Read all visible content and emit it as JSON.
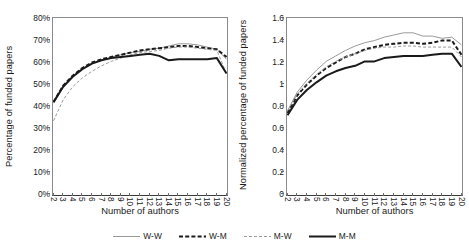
{
  "figure": {
    "background": "#ffffff",
    "axis_color": "#8a8a8a"
  },
  "legend": {
    "position": "bottom-center",
    "entries": [
      {
        "label": "W-W",
        "style": "solid",
        "color": "#9a9a9a",
        "width": 1.0,
        "name": "legend-item-w-w"
      },
      {
        "label": "W-M",
        "style": "dashed",
        "color": "#1a1a1a",
        "width": 2.0,
        "name": "legend-item-w-m"
      },
      {
        "label": "M-W",
        "style": "dashed",
        "color": "#9a9a9a",
        "width": 1.0,
        "name": "legend-item-m-w"
      },
      {
        "label": "M-M",
        "style": "solid",
        "color": "#1a1a1a",
        "width": 2.0,
        "name": "legend-item-m-m"
      }
    ]
  },
  "chart_data": [
    {
      "type": "line",
      "id": "left",
      "title": "",
      "xlabel": "Number of authors",
      "ylabel": "Percentage of funded papers",
      "x": [
        2,
        3,
        4,
        5,
        6,
        7,
        8,
        9,
        10,
        11,
        12,
        13,
        14,
        15,
        16,
        17,
        18,
        19,
        20
      ],
      "xlim": [
        2,
        20
      ],
      "xticklabels": [
        "2",
        "3",
        "4",
        "5",
        "6",
        "7",
        "8",
        "9",
        "10",
        "11",
        "12",
        "13",
        "14",
        "15",
        "16",
        "17",
        "18",
        "19",
        "20"
      ],
      "ylim": [
        0,
        80
      ],
      "yticks": [
        0,
        10,
        20,
        30,
        40,
        50,
        60,
        70,
        80
      ],
      "yticklabels": [
        "0%",
        "10%",
        "20%",
        "30%",
        "40%",
        "50%",
        "60%",
        "70%",
        "80%"
      ],
      "yunit": "%",
      "grid": false,
      "series": [
        {
          "name": "W-W",
          "values": [
            41.5,
            48.5,
            53.5,
            57.0,
            59.5,
            61.0,
            62.5,
            63.5,
            64.5,
            65.0,
            66.0,
            66.5,
            67.5,
            68.5,
            68.5,
            68.0,
            67.0,
            66.0,
            61.5
          ]
        },
        {
          "name": "W-M",
          "values": [
            42.0,
            49.5,
            54.0,
            57.5,
            60.0,
            61.5,
            62.5,
            63.5,
            64.5,
            65.5,
            66.0,
            66.5,
            67.0,
            67.5,
            67.5,
            67.0,
            66.5,
            66.0,
            62.5
          ]
        },
        {
          "name": "M-W",
          "values": [
            33.5,
            43.0,
            49.0,
            53.0,
            56.0,
            58.5,
            60.5,
            62.0,
            63.5,
            64.5,
            65.0,
            65.5,
            66.5,
            67.0,
            67.0,
            66.5,
            66.0,
            65.5,
            55.0
          ]
        },
        {
          "name": "M-M",
          "values": [
            42.0,
            49.0,
            53.5,
            57.0,
            59.5,
            61.0,
            62.0,
            62.5,
            63.0,
            63.5,
            64.0,
            63.0,
            61.0,
            61.5,
            61.5,
            61.5,
            61.5,
            62.0,
            55.0
          ]
        }
      ]
    },
    {
      "type": "line",
      "id": "right",
      "title": "",
      "xlabel": "Number of authors",
      "ylabel": "Normalized percentage of funded papers",
      "x": [
        2,
        3,
        4,
        5,
        6,
        7,
        8,
        9,
        10,
        11,
        12,
        13,
        14,
        15,
        16,
        17,
        18,
        19,
        20
      ],
      "xlim": [
        2,
        20
      ],
      "xticklabels": [
        "2",
        "3",
        "4",
        "5",
        "6",
        "7",
        "8",
        "9",
        "10",
        "11",
        "12",
        "13",
        "14",
        "15",
        "16",
        "17",
        "18",
        "19",
        "20"
      ],
      "ylim": [
        0,
        1.6
      ],
      "yticks": [
        0,
        0.2,
        0.4,
        0.6,
        0.8,
        1.0,
        1.2,
        1.4,
        1.6
      ],
      "yticklabels": [
        "0",
        "0.2",
        "0.4",
        "0.6",
        "0.8",
        "1",
        "1.2",
        "1.4",
        "1.6"
      ],
      "yunit": "",
      "grid": false,
      "series": [
        {
          "name": "W-W",
          "values": [
            0.76,
            0.93,
            1.04,
            1.13,
            1.21,
            1.26,
            1.31,
            1.35,
            1.38,
            1.4,
            1.43,
            1.45,
            1.47,
            1.47,
            1.44,
            1.44,
            1.42,
            1.43,
            1.36
          ]
        },
        {
          "name": "W-M",
          "values": [
            0.74,
            0.9,
            1.0,
            1.08,
            1.15,
            1.2,
            1.25,
            1.28,
            1.32,
            1.34,
            1.36,
            1.37,
            1.38,
            1.38,
            1.37,
            1.38,
            1.4,
            1.4,
            1.27
          ]
        },
        {
          "name": "M-W",
          "values": [
            0.76,
            0.91,
            1.01,
            1.09,
            1.16,
            1.21,
            1.25,
            1.28,
            1.31,
            1.33,
            1.34,
            1.34,
            1.35,
            1.35,
            1.34,
            1.34,
            1.34,
            1.34,
            1.25
          ]
        },
        {
          "name": "M-M",
          "values": [
            0.72,
            0.86,
            0.95,
            1.02,
            1.08,
            1.12,
            1.15,
            1.17,
            1.21,
            1.21,
            1.24,
            1.25,
            1.26,
            1.26,
            1.26,
            1.27,
            1.28,
            1.28,
            1.16
          ]
        }
      ]
    }
  ]
}
